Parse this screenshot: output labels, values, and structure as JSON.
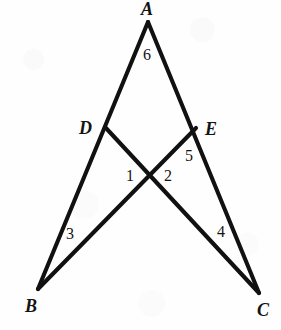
{
  "figure": {
    "kind": "geometry-diagram",
    "background_color": "#fefefe",
    "stroke_color": "#111111",
    "text_color": "#141414",
    "canvas": {
      "width": 281,
      "height": 330
    },
    "points": {
      "A": {
        "x": 148,
        "y": 22
      },
      "B": {
        "x": 38,
        "y": 289
      },
      "C": {
        "x": 259,
        "y": 293
      },
      "D": {
        "x": 105,
        "y": 127
      },
      "E": {
        "x": 196,
        "y": 128
      },
      "P": {
        "x": 150,
        "y": 176
      }
    },
    "segments": [
      {
        "name": "segment-AB",
        "from": "A",
        "to": "B",
        "label": "A to B through D"
      },
      {
        "name": "segment-AC",
        "from": "A",
        "to": "C",
        "label": "A to C through E"
      },
      {
        "name": "segment-DC",
        "from": "D",
        "to": "C",
        "label": "D to C"
      },
      {
        "name": "segment-EB",
        "from": "E",
        "to": "B",
        "label": "E to B"
      }
    ],
    "vertex_labels": [
      {
        "name": "vertex-label-A",
        "text": "A",
        "x": 141,
        "y": 0
      },
      {
        "name": "vertex-label-D",
        "text": "D",
        "x": 79,
        "y": 119
      },
      {
        "name": "vertex-label-E",
        "text": "E",
        "x": 205,
        "y": 120
      },
      {
        "name": "vertex-label-B",
        "text": "B",
        "x": 25,
        "y": 297
      },
      {
        "name": "vertex-label-C",
        "text": "C",
        "x": 257,
        "y": 301
      }
    ],
    "angle_labels": [
      {
        "name": "angle-label-6",
        "text": "6",
        "x": 143,
        "y": 47
      },
      {
        "name": "angle-label-5",
        "text": "5",
        "x": 185,
        "y": 148
      },
      {
        "name": "angle-label-1",
        "text": "1",
        "x": 126,
        "y": 168
      },
      {
        "name": "angle-label-2",
        "text": "2",
        "x": 164,
        "y": 168
      },
      {
        "name": "angle-label-3",
        "text": "3",
        "x": 66,
        "y": 226
      },
      {
        "name": "angle-label-4",
        "text": "4",
        "x": 217,
        "y": 224
      }
    ]
  }
}
